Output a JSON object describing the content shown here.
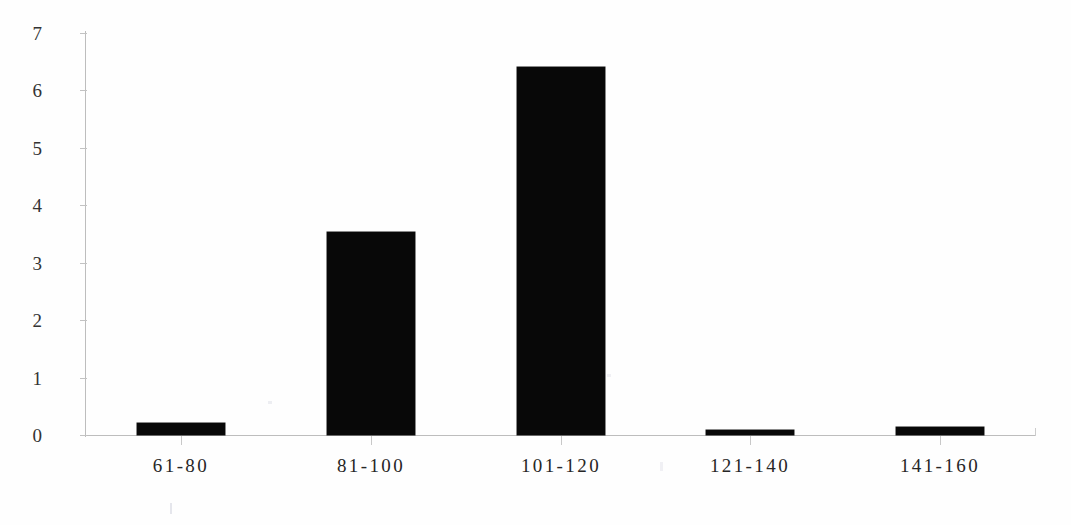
{
  "chart_data": {
    "type": "bar",
    "title": "",
    "subtitle": "",
    "xlabel": "",
    "ylabel": "",
    "categories": [
      "61-80",
      "81-100",
      "101-120",
      "121-140",
      "141-160"
    ],
    "values": [
      0.21,
      3.54,
      6.41,
      0.08,
      0.14
    ],
    "series": [
      {
        "name": "Frequency",
        "values": [
          0.21,
          3.54,
          6.41,
          0.08,
          0.14
        ]
      }
    ],
    "ylim": [
      0,
      7
    ],
    "ytick_labels": [
      "0",
      "1",
      "2",
      "3",
      "4",
      "5",
      "6",
      "7"
    ],
    "ytick_values": [
      0,
      1,
      2,
      3,
      4,
      5,
      6,
      7
    ],
    "grid": false,
    "legend": false,
    "legend_position": "none",
    "annotations": [],
    "colors": {
      "bar": "#080808",
      "axis": "#bdbdbd",
      "tick_label": "#333333",
      "category_label": "#262626",
      "background": "#fefefe"
    }
  }
}
